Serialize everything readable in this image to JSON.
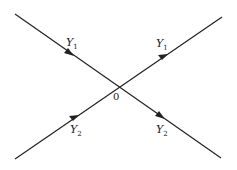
{
  "diagram": {
    "lines": [
      {
        "name": "line-1",
        "from": [
          15,
          14
        ],
        "to": [
          221,
          158
        ]
      },
      {
        "name": "line-2",
        "from": [
          15,
          159
        ],
        "to": [
          222,
          17
        ]
      }
    ],
    "origin_label": "0",
    "labels": [
      {
        "name": "label-y1-left",
        "base": "Y",
        "sub": "1"
      },
      {
        "name": "label-y1-right",
        "base": "Y",
        "sub": "1"
      },
      {
        "name": "label-y2-left",
        "base": "Y",
        "sub": "2"
      },
      {
        "name": "label-y2-right",
        "base": "Y",
        "sub": "2"
      }
    ],
    "line_color": "#222222"
  }
}
